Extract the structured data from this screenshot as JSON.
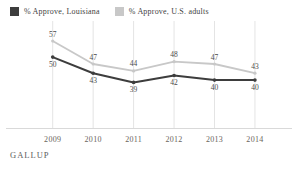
{
  "legend": {
    "items": [
      {
        "label": "% Approve, Louisiana",
        "color": "#3d3d3d"
      },
      {
        "label": "% Approve, U.S. adults",
        "color": "#c8c8c8"
      }
    ]
  },
  "source": "GALLUP",
  "chart_data": {
    "type": "line",
    "categories": [
      "2009",
      "2010",
      "2011",
      "2012",
      "2013",
      "2014"
    ],
    "series": [
      {
        "name": "% Approve, Louisiana",
        "values": [
          50,
          43,
          39,
          42,
          40,
          40
        ],
        "color": "#3d3d3d",
        "label_position": "below"
      },
      {
        "name": "% Approve, U.S. adults",
        "values": [
          57,
          47,
          44,
          48,
          47,
          43
        ],
        "color": "#c8c8c8",
        "label_position": "above"
      }
    ],
    "title": "",
    "xlabel": "",
    "ylabel": "",
    "ylim": [
      20,
      60
    ],
    "grid": "vertical",
    "legend_position": "top-left",
    "source": "GALLUP",
    "colors": {
      "gridline": "#e4e4e4",
      "axis": "#d9d9d9",
      "data_label": "#4a4a4a",
      "year_label": "#6a645c"
    }
  }
}
